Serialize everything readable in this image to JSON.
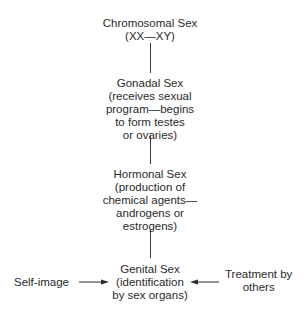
{
  "diagram": {
    "type": "flow",
    "direction": "top-to-bottom",
    "nodes": [
      {
        "id": "chromosomal",
        "lines": [
          "Chromosomal Sex",
          "(XX—XY)"
        ]
      },
      {
        "id": "gonadal",
        "lines": [
          "Gonadal Sex",
          "(receives sexual",
          "program—begins",
          "to form testes",
          "or ovaries)"
        ]
      },
      {
        "id": "hormonal",
        "lines": [
          "Hormonal Sex",
          "(production of",
          "chemical agents—",
          "androgens or",
          "estrogens)"
        ]
      },
      {
        "id": "genital",
        "lines": [
          "Genital Sex",
          "(identification",
          "by sex organs)"
        ]
      }
    ],
    "side_inputs": [
      {
        "id": "self-image",
        "lines": [
          "Self-image"
        ],
        "target": "genital",
        "side": "left"
      },
      {
        "id": "treatment",
        "lines": [
          "Treatment by",
          "others"
        ],
        "target": "genital",
        "side": "right"
      }
    ],
    "edges": [
      {
        "from": "chromosomal",
        "to": "gonadal"
      },
      {
        "from": "gonadal",
        "to": "hormonal"
      },
      {
        "from": "hormonal",
        "to": "genital"
      },
      {
        "from": "self-image",
        "to": "genital",
        "arrow": true
      },
      {
        "from": "treatment",
        "to": "genital",
        "arrow": true
      }
    ]
  }
}
